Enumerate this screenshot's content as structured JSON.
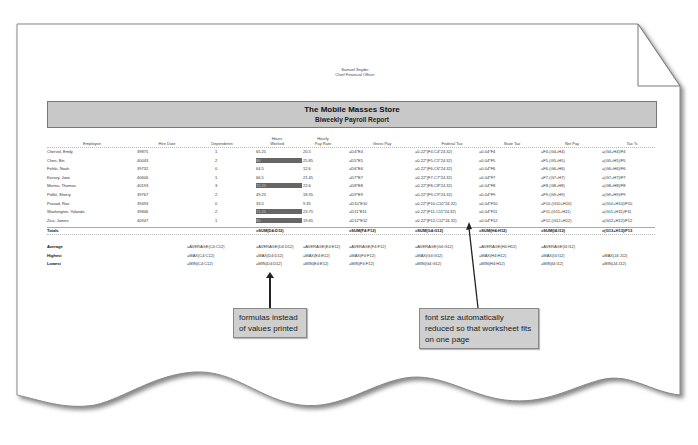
{
  "document": {
    "signature_name": "Samuel Snyder",
    "signature_title": "Chief Financial Officer",
    "title": "The Mobile Masses Store",
    "subtitle": "Biweekly Payroll Report"
  },
  "table": {
    "headers": {
      "employee": "Employee",
      "hire_date": "Hire Date",
      "dependents": "Dependents",
      "hours_worked_1": "Hours",
      "hours_worked_2": "Worked",
      "pay_rate_1": "Hourly",
      "pay_rate_2": "Pay Rate",
      "gross_pay": "Gross Pay",
      "federal_tax": "Federal Tax",
      "state_tax": "State Tax",
      "net_pay": "Net Pay",
      "tax_pct": "Tax %"
    },
    "rows": [
      {
        "employee": "Chervel, Emily",
        "hire_date": "39875",
        "dependents": "1",
        "hours": "65.25",
        "rate": "20.5",
        "gross": "=D4*E4",
        "fed": "=0.22*(F4-C4*24.32)",
        "state": "=0.04*F4",
        "net": "=F4-(G4+H4)",
        "pct": "=(G4+H4)/F4",
        "hl": false
      },
      {
        "employee": "Chen, Bin",
        "hire_date": "40043",
        "dependents": "2",
        "hours": "80",
        "rate": "25.85",
        "gross": "=D5*E5",
        "fed": "=0.22*(F5-C5*24.32)",
        "state": "=0.04*F5",
        "net": "=F5-(G5+H5)",
        "pct": "=(G5+H5)/F5",
        "hl": true
      },
      {
        "employee": "Felski, Noah",
        "hire_date": "39732",
        "dependents": "0",
        "hours": "64.5",
        "rate": "12.6",
        "gross": "=D6*E6",
        "fed": "=0.22*(F6-C6*24.32)",
        "state": "=0.04*F6",
        "net": "=F6-(G6+H6)",
        "pct": "=(G6+H6)/F6",
        "hl": false
      },
      {
        "employee": "Kersey, Jane",
        "hire_date": "40606",
        "dependents": "1",
        "hours": "66.5",
        "rate": "21.45",
        "gross": "=D7*E7",
        "fed": "=0.22*(F7-C7*24.32)",
        "state": "=0.04*F7",
        "net": "=F7-(G7+H7)",
        "pct": "=(G7+H7)/F7",
        "hl": false
      },
      {
        "employee": "Menna, Thomas",
        "hire_date": "40193",
        "dependents": "3",
        "hours": "72.25",
        "rate": "22.6",
        "gross": "=D8*E8",
        "fed": "=0.22*(F8-C8*24.32)",
        "state": "=0.04*F8",
        "net": "=F8-(G8+H8)",
        "pct": "=(G8+H8)/F8",
        "hl": true
      },
      {
        "employee": "Pollitt, Sherry",
        "hire_date": "39767",
        "dependents": "2",
        "hours": "49.25",
        "rate": "18.35",
        "gross": "=D9*E9",
        "fed": "=0.22*(F9-C9*24.32)",
        "state": "=0.04*F9",
        "net": "=F9-(G9+H9)",
        "pct": "=(G9+H9)/F9",
        "hl": false
      },
      {
        "employee": "Prasad, Rao",
        "hire_date": "39493",
        "dependents": "0",
        "hours": "33.5",
        "rate": "9.35",
        "gross": "=D10*E10",
        "fed": "=0.22*(F10-C10*24.32)",
        "state": "=0.04*F10",
        "net": "=F10-(G10+H10)",
        "pct": "=(G10+H10)/F10",
        "hl": false
      },
      {
        "employee": "Washington, Yolanda",
        "hire_date": "39846",
        "dependents": "2",
        "hours": "71.25",
        "rate": "23.75",
        "gross": "=D11*E11",
        "fed": "=0.22*(F11-C11*24.32)",
        "state": "=0.04*F11",
        "net": "=F11-(G11+H11)",
        "pct": "=(G11+H11)/F11",
        "hl": true
      },
      {
        "employee": "Zico, James",
        "hire_date": "40947",
        "dependents": "1",
        "hours": "80",
        "rate": "19.65",
        "gross": "=D12*E12",
        "fed": "=0.22*(F12-C12*24.32)",
        "state": "=0.04*F12",
        "net": "=F12-(G12+H12)",
        "pct": "=(G12+H12)/F12",
        "hl": true
      }
    ],
    "totals": {
      "label": "Totals",
      "hours": "=SUM(D4:D12)",
      "gross": "=SUM(F4:F12)",
      "fed": "=SUM(G4:G12)",
      "state": "=SUM(H4:H12)",
      "net": "=SUM(I4:I12)",
      "pct": "=(G13+H13)/F13"
    },
    "summary": [
      {
        "label": "Average",
        "dependents": "=AVERAGE(C4:C12)",
        "hours": "=AVERAGE(D4:D12)",
        "rate": "=AVERAGE(E4:E12)",
        "gross": "=AVERAGE(F4:F12)",
        "fed": "=AVERAGE(G4:G12)",
        "state": "=AVERAGE(H4:H12)",
        "net": "=AVERAGE(I4:I12)",
        "pct": ""
      },
      {
        "label": "Highest",
        "dependents": "=MAX(C4:C12)",
        "hours": "=MAX(D4:D12)",
        "rate": "=MAX(E4:E12)",
        "gross": "=MAX(F4:F12)",
        "fed": "=MAX(G4:G12)",
        "state": "=MAX(H4:H12)",
        "net": "=MAX(I4:I12)",
        "pct": "=MAX(J4:J12)"
      },
      {
        "label": "Lowest",
        "dependents": "=MIN(C4:C12)",
        "hours": "=MIN(D4:D12)",
        "rate": "=MIN(E4:E12)",
        "gross": "=MIN(F4:F12)",
        "fed": "=MIN(G4:G12)",
        "state": "=MIN(H4:H12)",
        "net": "=MIN(I4:I12)",
        "pct": "=MIN(J4:J12)"
      }
    ]
  },
  "callouts": {
    "formulas": "formulas instead of values printed",
    "font_size": "font size automatically reduced so that worksheet fits on one page"
  }
}
